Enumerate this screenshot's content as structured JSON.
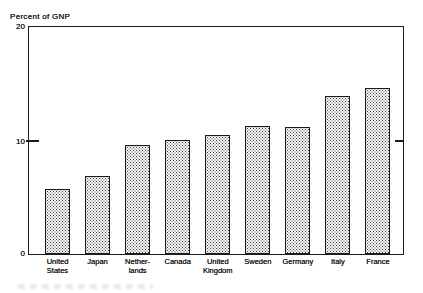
{
  "figure": {
    "background": "#ffffff",
    "line_color": "#1c1c1c",
    "text_color": "#1f1f1f"
  },
  "axis": {
    "y_tick_labels": [
      "20",
      "10",
      "0"
    ]
  },
  "chart_data": {
    "type": "bar",
    "title": "Percent of GNP",
    "ylabel": "Percent of GNP",
    "xlabel": "",
    "ylim": [
      0,
      20
    ],
    "yticks": [
      0,
      10,
      20
    ],
    "grid": false,
    "legend": null,
    "categories": [
      "United States",
      "Japan",
      "Netherlands",
      "Canada",
      "United Kingdom",
      "Sweden",
      "Germany",
      "Italy",
      "France"
    ],
    "category_display_lines": [
      [
        "United",
        "States"
      ],
      [
        "Japan"
      ],
      [
        "Nether-",
        "lands"
      ],
      [
        "Canada"
      ],
      [
        "United",
        "Kingdom"
      ],
      [
        "Sweden"
      ],
      [
        "Germany"
      ],
      [
        "Italy"
      ],
      [
        "France"
      ]
    ],
    "values": [
      5.7,
      6.9,
      9.6,
      10.0,
      10.5,
      11.3,
      11.2,
      13.9,
      14.6
    ],
    "bar_style": {
      "fill": "#f9f9f9",
      "pattern": "halftone-dots",
      "dot_color": "#3f3f3f",
      "border": "#1c1c1c"
    }
  }
}
